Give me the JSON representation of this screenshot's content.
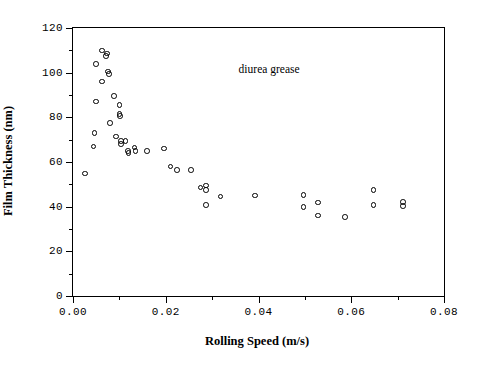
{
  "figure": {
    "width": 479,
    "height": 371,
    "background": "#ffffff",
    "foreground": "#000000"
  },
  "annotation_label": "diurea grease",
  "axis": {
    "x_title": "Rolling Speed (m/s)",
    "y_title": "Film Thickness (nm)",
    "x_ticks": [
      "0.00",
      "0.02",
      "0.04",
      "0.06",
      "0.08"
    ],
    "y_ticks": [
      "0",
      "20",
      "40",
      "60",
      "80",
      "100",
      "120"
    ]
  },
  "chart_data": {
    "type": "scatter",
    "title": "",
    "subtitle": "",
    "xlabel": "Rolling Speed (m/s)",
    "ylabel": "Film Thickness (nm)",
    "xlim": [
      0.0,
      0.08
    ],
    "ylim": [
      0,
      120
    ],
    "xticks": [
      0.0,
      0.02,
      0.04,
      0.06,
      0.08
    ],
    "yticks": [
      0,
      20,
      40,
      60,
      80,
      100,
      120
    ],
    "x_minor_ticks": [
      0.01,
      0.03,
      0.05,
      0.07
    ],
    "y_minor_ticks": [
      10,
      30,
      50,
      70,
      90,
      110
    ],
    "grid": false,
    "legend": false,
    "annotations": [
      {
        "text": "diurea grease",
        "x": 0.0425,
        "y": 101.0
      }
    ],
    "marker": "open-circle",
    "marker_color": "#000000",
    "series": [
      {
        "name": "diurea grease",
        "points": [
          {
            "x": 0.0026,
            "y": 54.8
          },
          {
            "x": 0.0046,
            "y": 73.0
          },
          {
            "x": 0.0044,
            "y": 67.0
          },
          {
            "x": 0.0062,
            "y": 96.0
          },
          {
            "x": 0.005,
            "y": 104.0
          },
          {
            "x": 0.0062,
            "y": 110.0
          },
          {
            "x": 0.0071,
            "y": 107.5
          },
          {
            "x": 0.0073,
            "y": 108.5
          },
          {
            "x": 0.0076,
            "y": 100.5
          },
          {
            "x": 0.0078,
            "y": 99.5
          },
          {
            "x": 0.005,
            "y": 87.0
          },
          {
            "x": 0.0089,
            "y": 89.5
          },
          {
            "x": 0.008,
            "y": 77.5
          },
          {
            "x": 0.01,
            "y": 85.5
          },
          {
            "x": 0.01,
            "y": 81.5
          },
          {
            "x": 0.0101,
            "y": 80.5
          },
          {
            "x": 0.0093,
            "y": 71.5
          },
          {
            "x": 0.0103,
            "y": 69.5
          },
          {
            "x": 0.0104,
            "y": 68.0
          },
          {
            "x": 0.0113,
            "y": 69.5
          },
          {
            "x": 0.0118,
            "y": 65.0
          },
          {
            "x": 0.012,
            "y": 64.0
          },
          {
            "x": 0.0133,
            "y": 66.5
          },
          {
            "x": 0.0135,
            "y": 65.0
          },
          {
            "x": 0.016,
            "y": 65.0
          },
          {
            "x": 0.0196,
            "y": 66.0
          },
          {
            "x": 0.021,
            "y": 58.0
          },
          {
            "x": 0.0224,
            "y": 56.5
          },
          {
            "x": 0.0254,
            "y": 56.5
          },
          {
            "x": 0.0275,
            "y": 48.5
          },
          {
            "x": 0.0287,
            "y": 49.5
          },
          {
            "x": 0.0287,
            "y": 47.5
          },
          {
            "x": 0.0287,
            "y": 40.8
          },
          {
            "x": 0.0318,
            "y": 44.5
          },
          {
            "x": 0.0393,
            "y": 45.0
          },
          {
            "x": 0.0497,
            "y": 45.2
          },
          {
            "x": 0.0497,
            "y": 39.8
          },
          {
            "x": 0.0528,
            "y": 41.8
          },
          {
            "x": 0.0528,
            "y": 36.0
          },
          {
            "x": 0.0586,
            "y": 35.5
          },
          {
            "x": 0.0648,
            "y": 47.5
          },
          {
            "x": 0.0648,
            "y": 40.8
          },
          {
            "x": 0.0711,
            "y": 42.2
          },
          {
            "x": 0.0711,
            "y": 40.2
          }
        ]
      }
    ]
  }
}
